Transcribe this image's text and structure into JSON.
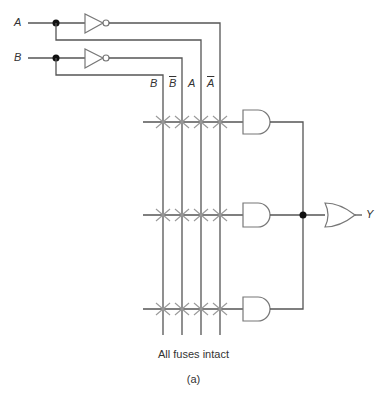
{
  "diagram": {
    "type": "PLA / programmable AND-OR array",
    "inputs": [
      {
        "name": "A",
        "label": "A"
      },
      {
        "name": "B",
        "label": "B"
      }
    ],
    "bus_labels": [
      "B",
      "B",
      "A",
      "A"
    ],
    "bus_labels_overlined": [
      false,
      true,
      false,
      true
    ],
    "and_gates": 3,
    "or_gates": 1,
    "output_label": "Y",
    "caption": "All fuses intact",
    "subcaption": "(a)",
    "colors": {
      "wire": "#555555",
      "fuse": "#999999",
      "gate_outline": "#777777",
      "junction": "#111111"
    }
  }
}
